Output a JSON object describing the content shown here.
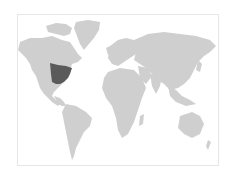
{
  "map": {
    "type": "world-choropleth",
    "highlighted_region": "Central and Eastern United States",
    "colors": {
      "background": "#ffffff",
      "land": "#cfcfcf",
      "highlight": "#5a5a5a",
      "border": "#e6e6e6"
    }
  }
}
